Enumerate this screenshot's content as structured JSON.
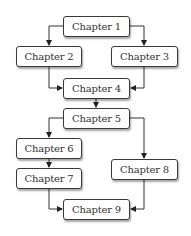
{
  "diagram": {
    "type": "flowchart",
    "nodes": [
      {
        "id": "ch1",
        "label": "Chapter 1"
      },
      {
        "id": "ch2",
        "label": "Chapter 2"
      },
      {
        "id": "ch3",
        "label": "Chapter 3"
      },
      {
        "id": "ch4",
        "label": "Chapter 4"
      },
      {
        "id": "ch5",
        "label": "Chapter 5"
      },
      {
        "id": "ch6",
        "label": "Chapter 6"
      },
      {
        "id": "ch7",
        "label": "Chapter 7"
      },
      {
        "id": "ch8",
        "label": "Chapter 8"
      },
      {
        "id": "ch9",
        "label": "Chapter 9"
      }
    ],
    "edges": [
      {
        "from": "ch1",
        "to": "ch2"
      },
      {
        "from": "ch1",
        "to": "ch3"
      },
      {
        "from": "ch2",
        "to": "ch4"
      },
      {
        "from": "ch3",
        "to": "ch4"
      },
      {
        "from": "ch4",
        "to": "ch5"
      },
      {
        "from": "ch5",
        "to": "ch6"
      },
      {
        "from": "ch5",
        "to": "ch8"
      },
      {
        "from": "ch6",
        "to": "ch7"
      },
      {
        "from": "ch7",
        "to": "ch9"
      },
      {
        "from": "ch8",
        "to": "ch9"
      }
    ]
  }
}
